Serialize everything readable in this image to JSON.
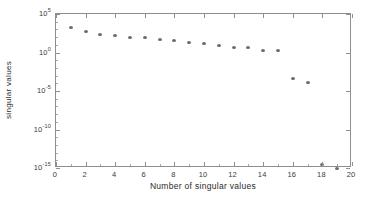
{
  "chart_data": {
    "type": "scatter",
    "title": "",
    "xlabel": "Number of singular values",
    "ylabel": "singular values",
    "xlim": [
      0,
      20
    ],
    "ylim": [
      1e-15,
      100000.0
    ],
    "yscale": "log",
    "xscale": "linear",
    "grid": false,
    "legend": null,
    "marker": {
      "shape": "circle",
      "color": "#6b6b6b",
      "size": 4
    },
    "xticks": [
      {
        "value": 0,
        "label": "0"
      },
      {
        "value": 2,
        "label": "2"
      },
      {
        "value": 4,
        "label": "4"
      },
      {
        "value": 6,
        "label": "6"
      },
      {
        "value": 8,
        "label": "8"
      },
      {
        "value": 10,
        "label": "10"
      },
      {
        "value": 12,
        "label": "12"
      },
      {
        "value": 14,
        "label": "14"
      },
      {
        "value": 16,
        "label": "16"
      },
      {
        "value": 18,
        "label": "18"
      },
      {
        "value": 20,
        "label": "20"
      }
    ],
    "yticks": [
      {
        "exp": 5,
        "mantissa": "10",
        "label": "10^5"
      },
      {
        "exp": 0,
        "mantissa": "10",
        "label": "10^0"
      },
      {
        "exp": -5,
        "mantissa": "10",
        "label": "10^-5"
      },
      {
        "exp": -10,
        "mantissa": "10",
        "label": "10^-10"
      },
      {
        "exp": -15,
        "mantissa": "10",
        "label": "10^-15"
      }
    ],
    "x": [
      1,
      2,
      3,
      4,
      5,
      6,
      7,
      8,
      9,
      10,
      11,
      12,
      13,
      14,
      15,
      16,
      17,
      18,
      19
    ],
    "y": [
      1600.0,
      500.0,
      250.0,
      160.0,
      100.0,
      79.0,
      50.0,
      32.0,
      20.0,
      13.0,
      7.9,
      5.0,
      5.0,
      2.0,
      1.6,
      0.0004,
      0.00013,
      3.2e-15,
      1e-15
    ],
    "n_points": 19,
    "annotations": []
  },
  "axes": {
    "frame_color": "#8e8e8e",
    "background": "#ffffff"
  }
}
